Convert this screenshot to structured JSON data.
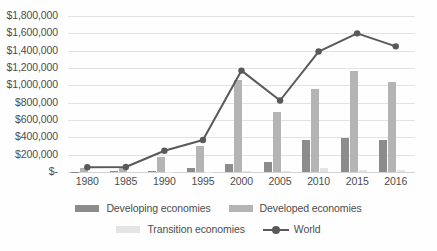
{
  "chart_data": {
    "type": "bar",
    "title": "",
    "xlabel": "",
    "ylabel": "",
    "ylim": [
      0,
      1800000
    ],
    "grid": true,
    "legend_position": "bottom",
    "categories": [
      "1980",
      "1985",
      "1990",
      "1995",
      "2000",
      "2005",
      "2010",
      "2015",
      "2016"
    ],
    "y_ticks": [
      "$1,800,000",
      "$1,600,000",
      "$1,400,000",
      "$1,200,000",
      "$1,000,000",
      "$800,000",
      "$600,000",
      "$400,000",
      "$200,000",
      "$-"
    ],
    "y_tick_values": [
      1800000,
      1600000,
      1400000,
      1200000,
      1000000,
      800000,
      600000,
      400000,
      200000,
      0
    ],
    "series": [
      {
        "name": "Developing economies",
        "kind": "bar",
        "color": "#8c8c8c",
        "values": [
          4000,
          6000,
          12000,
          50000,
          90000,
          120000,
          370000,
          390000,
          375000
        ]
      },
      {
        "name": "Developed economies",
        "kind": "bar",
        "color": "#b4b4b4",
        "values": [
          48000,
          50000,
          175000,
          300000,
          1060000,
          695000,
          960000,
          1165000,
          1035000
        ]
      },
      {
        "name": "Transition economies",
        "kind": "bar",
        "color": "#e4e4e4",
        "values": [
          0,
          0,
          1000,
          4000,
          7000,
          15000,
          45000,
          25000,
          25000
        ]
      },
      {
        "name": "World",
        "kind": "line",
        "color": "#595959",
        "values": [
          55000,
          58000,
          245000,
          370000,
          1170000,
          825000,
          1390000,
          1600000,
          1450000
        ]
      }
    ]
  },
  "legend": {
    "items": [
      {
        "label": "Developing economies",
        "swatch": "developing"
      },
      {
        "label": "Developed economies",
        "swatch": "developed"
      },
      {
        "label": "Transition economies",
        "swatch": "transition"
      },
      {
        "label": "World",
        "swatch": "line"
      }
    ]
  }
}
